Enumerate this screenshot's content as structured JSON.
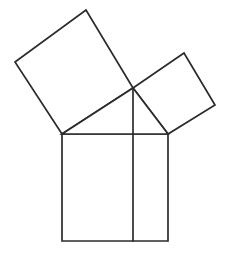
{
  "figure": {
    "background_color": "#ffffff",
    "stroke_color": "#2b2b2b",
    "fill_color": "#ffffff",
    "stroke_width": 1.7,
    "canvas": {
      "width": 233,
      "height": 254
    },
    "points": {
      "triangle_left": {
        "x": 62,
        "y": 134,
        "label": "A"
      },
      "triangle_right": {
        "x": 168,
        "y": 134,
        "label": "B"
      },
      "triangle_apex": {
        "x": 133,
        "y": 88,
        "label": "C"
      },
      "foot_of_altitude": {
        "x": 133,
        "y": 241,
        "label": "D"
      },
      "big_square_left": {
        "x": 15,
        "y": 62
      },
      "big_square_top": {
        "x": 86,
        "y": 10
      },
      "small_square_top": {
        "x": 184,
        "y": 53
      },
      "small_square_right": {
        "x": 215,
        "y": 105
      },
      "base_square_bottom_left": {
        "x": 62,
        "y": 241
      },
      "base_square_bottom_right": {
        "x": 168,
        "y": 241
      }
    },
    "shapes": [
      {
        "name": "hypotenuse-square",
        "role": "square on the bottom (hypotenuse) side",
        "points": "62,134 168,134 168,241 62,241"
      },
      {
        "name": "large-leg-square",
        "role": "square on the longer leg (upper left)",
        "points": "62,134 15,62 86,10 133,88"
      },
      {
        "name": "small-leg-square",
        "role": "square on the shorter leg (upper right)",
        "points": "133,88 184,53 215,105 168,134"
      },
      {
        "name": "right-triangle",
        "role": "central right triangle",
        "points": "62,134 168,134 133,88"
      }
    ],
    "lines": [
      {
        "name": "altitude-line",
        "role": "vertical line from right-angle vertex through the hypotenuse square",
        "x1": 133,
        "y1": 88,
        "x2": 133,
        "y2": 241
      }
    ]
  }
}
